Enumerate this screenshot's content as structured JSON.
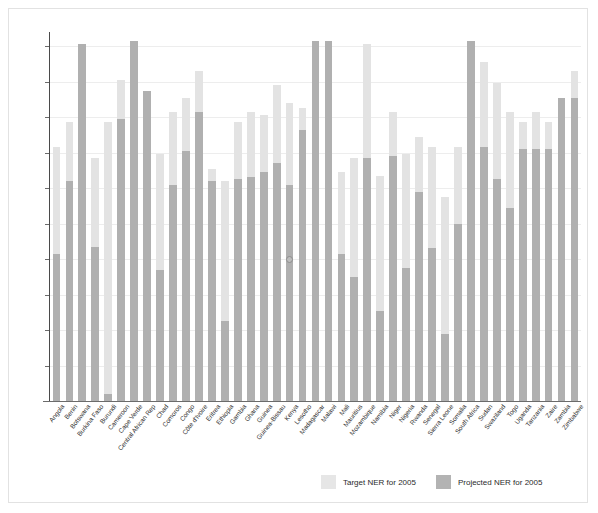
{
  "chart_data": {
    "type": "bar",
    "title": "",
    "subtitle": "",
    "xlabel": "",
    "ylabel": "",
    "ylim": [
      0,
      104
    ],
    "yticks": [
      10,
      20,
      30,
      40,
      50,
      60,
      70,
      80,
      90,
      100
    ],
    "grid": true,
    "legend_position": "bottom-right",
    "categories": [
      "Angola",
      "Benin",
      "Botswana",
      "Burkina Faso",
      "Burundi",
      "Cameroon",
      "Cape Verde",
      "Central African Rep",
      "Chad",
      "Comoros",
      "Congo",
      "Côte d'Ivoire",
      "Eritrea",
      "Ethiopia",
      "Gambia",
      "Ghana",
      "Guinea",
      "Guinea-Bissau",
      "Kenya",
      "Lesotho",
      "Madagascar",
      "Malawi",
      "Mali",
      "Mauritius",
      "Mozambique",
      "Namibia",
      "Niger",
      "Nigeria",
      "Rwanda",
      "Senegal",
      "Sierra Leone",
      "Somalia",
      "South Africa",
      "Sudan",
      "Swaziland",
      "Togo",
      "Uganda",
      "Tanzania",
      "Zaire",
      "Zambia",
      "Zimbabwe"
    ],
    "series": [
      {
        "name": "Target NER for 2005",
        "color": "#e3e3e3",
        "values": [
          71.5,
          78.5,
          100.5,
          68.5,
          78.5,
          90.5,
          101.5,
          87.5,
          69.5,
          81.5,
          85.5,
          93,
          65.5,
          62,
          78.5,
          81.5,
          80.5,
          89,
          84,
          82.5,
          101.5,
          101.5,
          64.5,
          68.5,
          100.5,
          63.5,
          81.5,
          69.5,
          74.5,
          71.5,
          57.5,
          71.5,
          101.5,
          95.5,
          89.5,
          81.5,
          78.5,
          81.5,
          78.5,
          84.5,
          93
        ]
      },
      {
        "name": "Projected NER for 2005",
        "color": "#b0b0b0",
        "values": [
          41.5,
          62,
          100.5,
          43.5,
          2,
          79.5,
          101.5,
          87.5,
          37,
          61,
          70.5,
          81.5,
          62,
          22.5,
          62.5,
          63,
          64.5,
          67,
          61,
          76.5,
          101.5,
          101.5,
          41.5,
          35,
          68.5,
          25.5,
          69,
          37.5,
          59,
          43,
          19,
          50,
          101.5,
          71.5,
          62.5,
          54.5,
          71,
          71,
          71,
          85.5,
          85.5
        ]
      }
    ],
    "annotations": [
      {
        "name": "data-point-marker",
        "category": "Kenya",
        "value": 40
      }
    ]
  },
  "legend": {
    "items": [
      {
        "label": "Target NER for 2005",
        "swatch": "target"
      },
      {
        "label": "Projected NER for 2005",
        "swatch": "projected"
      }
    ]
  }
}
